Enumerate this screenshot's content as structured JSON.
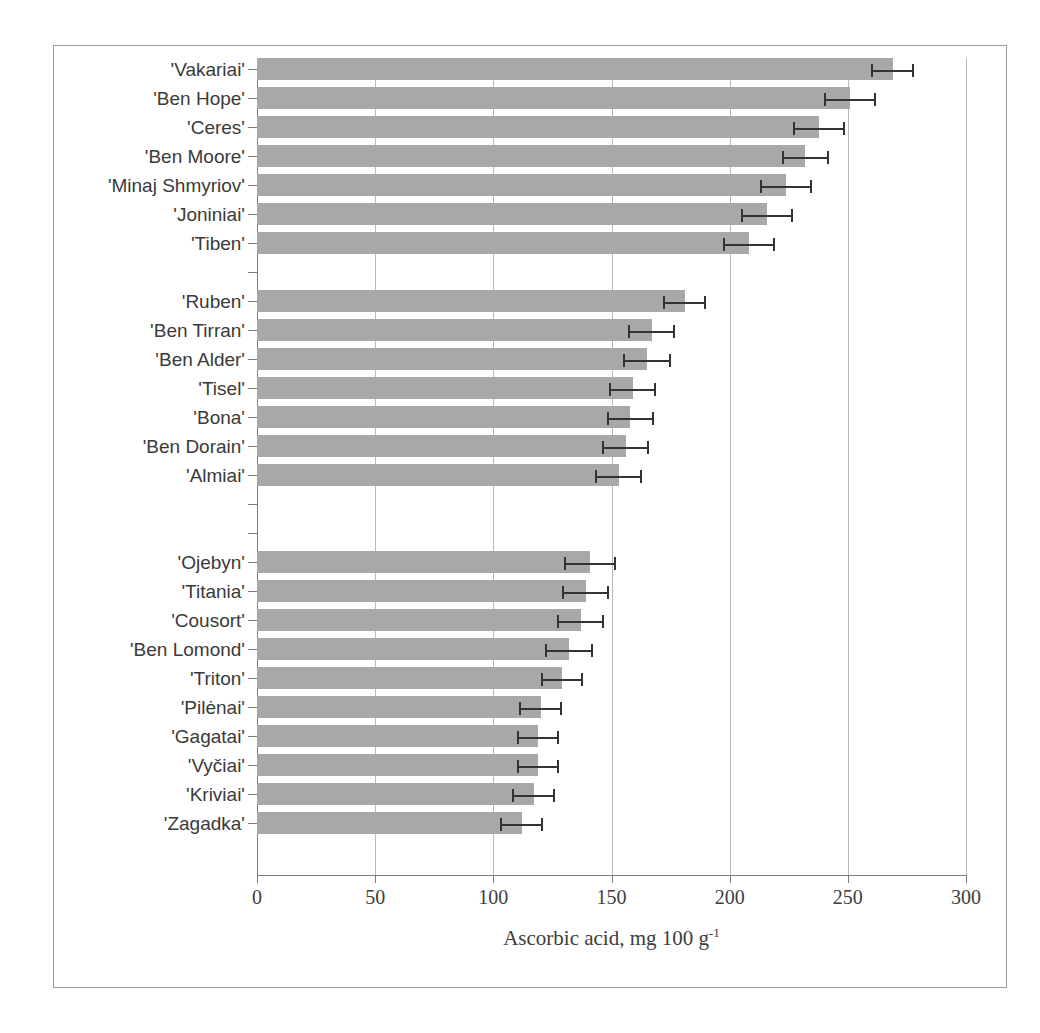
{
  "figure": {
    "background_color": "#ffffff",
    "frame_color": "#9a9a9a",
    "bar_color": "#a8a8a8",
    "error_bar_color": "#333333",
    "gridline_color": "#b9b9b9",
    "axis_color": "#7d7d7d"
  },
  "axis": {
    "x_title_main": "Ascorbic acid, mg 100 g",
    "x_title_exponent": "-1",
    "x_ticks": [
      "0",
      "50",
      "100",
      "150",
      "200",
      "250",
      "300"
    ]
  },
  "chart_data": {
    "type": "bar",
    "orientation": "horizontal",
    "title": "",
    "subtitle": "",
    "xlabel": "Ascorbic acid, mg 100 g-1",
    "ylabel": "",
    "xlim": [
      0,
      300
    ],
    "xticks": [
      0,
      50,
      100,
      150,
      200,
      250,
      300
    ],
    "grid": "vertical",
    "legend": "none",
    "error_bars": "symmetric (standard error)",
    "groups": [
      {
        "name": "high-ascorbic-group",
        "categories": [
          "'Vakariai'",
          "'Ben Hope'",
          "'Ceres'",
          "'Ben Moore'",
          "'Minaj Shmyriov'",
          "'Joniniai'",
          "'Tiben'"
        ],
        "values": [
          269,
          251,
          238,
          232,
          224,
          216,
          208
        ],
        "errors": [
          9,
          11,
          11,
          10,
          11,
          11,
          11
        ]
      },
      {
        "name": "mid-ascorbic-group",
        "categories": [
          "'Ruben'",
          "'Ben Tirran'",
          "'Ben Alder'",
          "'Tisel'",
          "'Bona'",
          "'Ben Dorain'",
          "'Almiai'"
        ],
        "values": [
          181,
          167,
          165,
          159,
          158,
          156,
          153
        ],
        "errors": [
          9,
          10,
          10,
          10,
          10,
          10,
          10
        ]
      },
      {
        "name": "low-ascorbic-group",
        "categories": [
          "'Ojebyn'",
          "'Titania'",
          "'Cousort'",
          "'Ben Lomond'",
          "'Triton'",
          "'Pilėnai'",
          "'Gagatai'",
          "'Vyčiai'",
          "'Kriviai'",
          "'Zagadka'"
        ],
        "values": [
          141,
          139,
          137,
          132,
          129,
          120,
          119,
          119,
          117,
          112
        ],
        "errors": [
          11,
          10,
          10,
          10,
          9,
          9,
          9,
          9,
          9,
          9
        ]
      }
    ],
    "rows": [
      {
        "label": "'Vakariai'",
        "value": 269,
        "error": 9,
        "slot": 0
      },
      {
        "label": "'Ben Hope'",
        "value": 251,
        "error": 11,
        "slot": 1
      },
      {
        "label": "'Ceres'",
        "value": 238,
        "error": 11,
        "slot": 2
      },
      {
        "label": "'Ben Moore'",
        "value": 232,
        "error": 10,
        "slot": 3
      },
      {
        "label": "'Minaj Shmyriov'",
        "value": 224,
        "error": 11,
        "slot": 4
      },
      {
        "label": "'Joniniai'",
        "value": 216,
        "error": 11,
        "slot": 5
      },
      {
        "label": "'Tiben'",
        "value": 208,
        "error": 11,
        "slot": 6
      },
      {
        "label": "",
        "value": 0,
        "error": 0,
        "slot": 7
      },
      {
        "label": "'Ruben'",
        "value": 181,
        "error": 9,
        "slot": 8
      },
      {
        "label": "'Ben Tirran'",
        "value": 167,
        "error": 10,
        "slot": 9
      },
      {
        "label": "'Ben Alder'",
        "value": 165,
        "error": 10,
        "slot": 10
      },
      {
        "label": "'Tisel'",
        "value": 159,
        "error": 10,
        "slot": 11
      },
      {
        "label": "'Bona'",
        "value": 158,
        "error": 10,
        "slot": 12
      },
      {
        "label": "'Ben Dorain'",
        "value": 156,
        "error": 10,
        "slot": 13
      },
      {
        "label": "'Almiai'",
        "value": 153,
        "error": 10,
        "slot": 14
      },
      {
        "label": "",
        "value": 0,
        "error": 0,
        "slot": 15
      },
      {
        "label": "",
        "value": 0,
        "error": 0,
        "slot": 16
      },
      {
        "label": "'Ojebyn'",
        "value": 141,
        "error": 11,
        "slot": 17
      },
      {
        "label": "'Titania'",
        "value": 139,
        "error": 10,
        "slot": 18
      },
      {
        "label": "'Cousort'",
        "value": 137,
        "error": 10,
        "slot": 19
      },
      {
        "label": "'Ben Lomond'",
        "value": 132,
        "error": 10,
        "slot": 20
      },
      {
        "label": "'Triton'",
        "value": 129,
        "error": 9,
        "slot": 21
      },
      {
        "label": "'Pilėnai'",
        "value": 120,
        "error": 9,
        "slot": 22
      },
      {
        "label": "'Gagatai'",
        "value": 119,
        "error": 9,
        "slot": 23
      },
      {
        "label": "'Vyčiai'",
        "value": 119,
        "error": 9,
        "slot": 24
      },
      {
        "label": "'Kriviai'",
        "value": 117,
        "error": 9,
        "slot": 25
      },
      {
        "label": "'Zagadka'",
        "value": 112,
        "error": 9,
        "slot": 26
      }
    ]
  }
}
